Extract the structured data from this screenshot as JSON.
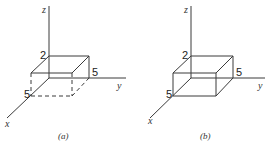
{
  "figures": [
    {
      "id": "a",
      "caption": "(a)",
      "axes": {
        "x": "x",
        "y": "y",
        "z": "z"
      },
      "dimensions": {
        "height_label": "2",
        "width_label": "5",
        "depth_label": "5"
      },
      "hidden_edges_dashed": true
    },
    {
      "id": "b",
      "caption": "(b)",
      "axes": {
        "x": "x",
        "y": "y",
        "z": "z"
      },
      "dimensions": {
        "height_label": "2",
        "width_label": "5",
        "depth_label": "5"
      },
      "hidden_edges_dashed": false
    }
  ]
}
